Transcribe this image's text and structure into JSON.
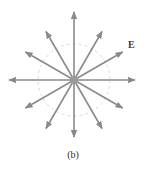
{
  "figure": {
    "caption": "(b)",
    "field_label": "E",
    "style": {
      "ray_color": "#8a8a8a",
      "dashed_circle_color": "#cfcfcf",
      "label_color": "#3a3a3a",
      "background": "#ffffff",
      "ray_stroke_width": 1.6,
      "dashed_circle_stroke_width": 0.8,
      "dash_pattern": "3,3"
    },
    "geometry": {
      "center_x": 74,
      "center_y": 80,
      "dashed_circle_radius": 36,
      "ray_count": 12,
      "ray_angle_step_deg": 30
    },
    "rays": [
      {
        "name": "ray-0deg-right",
        "angle_deg": 0,
        "length": 61
      },
      {
        "name": "ray-30deg",
        "angle_deg": 30,
        "length": 56
      },
      {
        "name": "ray-60deg",
        "angle_deg": 60,
        "length": 56
      },
      {
        "name": "ray-90deg-up",
        "angle_deg": 90,
        "length": 68
      },
      {
        "name": "ray-120deg",
        "angle_deg": 120,
        "length": 56
      },
      {
        "name": "ray-150deg",
        "angle_deg": 150,
        "length": 56
      },
      {
        "name": "ray-180deg-left",
        "angle_deg": 180,
        "length": 65
      },
      {
        "name": "ray-210deg",
        "angle_deg": 210,
        "length": 56
      },
      {
        "name": "ray-240deg",
        "angle_deg": 240,
        "length": 56
      },
      {
        "name": "ray-270deg-down",
        "angle_deg": 270,
        "length": 57
      },
      {
        "name": "ray-300deg",
        "angle_deg": 300,
        "length": 56
      },
      {
        "name": "ray-330deg",
        "angle_deg": 330,
        "length": 56
      }
    ]
  }
}
